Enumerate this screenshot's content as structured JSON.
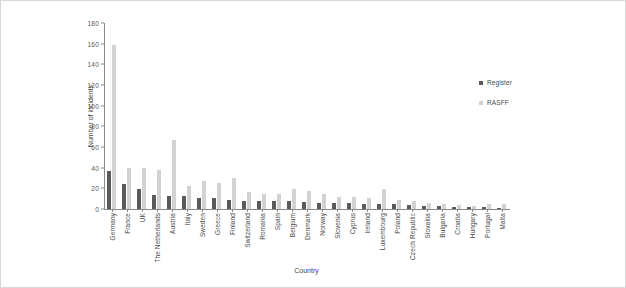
{
  "chart_data": {
    "type": "bar",
    "title": "",
    "xlabel": "Country",
    "ylabel": "Number of incidents",
    "ylim": [
      0,
      180
    ],
    "yticks": [
      0,
      20,
      40,
      60,
      80,
      100,
      120,
      140,
      160,
      180
    ],
    "grid": false,
    "legend_position": "right",
    "categories": [
      "Germany",
      "France",
      "UK",
      "The Netherlands",
      "Austria",
      "Italy",
      "Sweden",
      "Greece",
      "Finland",
      "Switzerland",
      "Romania",
      "Spain",
      "Belgium",
      "Denmark",
      "Norway",
      "Slovenia",
      "Cyprus",
      "Ireland",
      "Luxembourg",
      "Poland",
      "Czech Republic",
      "Slovakia",
      "Bulgaria",
      "Croatia",
      "Hungary",
      "Portugal",
      "Malta"
    ],
    "series": [
      {
        "name": "Register",
        "color": "#5a5a5a",
        "values": [
          37,
          24,
          19,
          14,
          13,
          13,
          11,
          11,
          9,
          8,
          8,
          8,
          8,
          7,
          6,
          6,
          6,
          5,
          5,
          5,
          4,
          3,
          3,
          2,
          2,
          2,
          1
        ]
      },
      {
        "name": "RASFF",
        "color": "#d2d2d2",
        "values": [
          159,
          40,
          40,
          38,
          67,
          22,
          27,
          25,
          30,
          16,
          15,
          15,
          19,
          17,
          15,
          12,
          12,
          11,
          19,
          9,
          8,
          6,
          5,
          4,
          3,
          5,
          5
        ]
      }
    ]
  },
  "legend": {
    "items": [
      {
        "label": "Register",
        "color": "#5a5a5a"
      },
      {
        "label": "RASFF",
        "color": "#d2d2d2"
      }
    ]
  }
}
